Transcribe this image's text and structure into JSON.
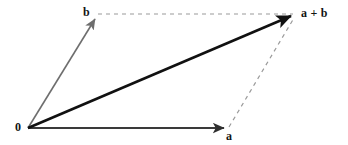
{
  "figure": {
    "kind": "vector-addition-parallelogram",
    "width": 348,
    "height": 145,
    "background": "#ffffff"
  },
  "labels": {
    "origin": "0",
    "vector_b": "b",
    "vector_a": "a",
    "vector_sum": "a + b"
  },
  "colors": {
    "sum_vector": "#111111",
    "vector_a": "#3a3a3a",
    "vector_b": "#6e6e6e",
    "dashed": "#9a9a9a",
    "label_text": "#141414"
  },
  "geometry": {
    "origin": [
      28,
      128
    ],
    "point_a": [
      228,
      128
    ],
    "point_b": [
      96,
      17
    ],
    "point_a_plus_b": [
      296,
      14
    ]
  },
  "strokes": {
    "sum_width": 2.6,
    "a_width": 1.8,
    "b_width": 1.6,
    "dash_width": 1.2,
    "dash_pattern": "4 4"
  }
}
